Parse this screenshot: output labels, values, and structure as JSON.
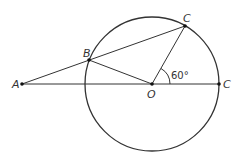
{
  "diagram": {
    "type": "geometry",
    "circle": {
      "center": "O",
      "cx": 152,
      "cy": 84,
      "r": 67
    },
    "points": [
      {
        "id": "A",
        "label": "A",
        "x": 22,
        "y": 84
      },
      {
        "id": "B",
        "label": "B",
        "x": 89,
        "y": 60
      },
      {
        "id": "O",
        "label": "O",
        "x": 152,
        "y": 84
      },
      {
        "id": "C_top",
        "label": "C",
        "x": 185,
        "y": 26
      },
      {
        "id": "C_right",
        "label": "C",
        "x": 219,
        "y": 84
      }
    ],
    "segments": [
      [
        "A",
        "C_right"
      ],
      [
        "A",
        "C_top"
      ],
      [
        "B",
        "O"
      ],
      [
        "O",
        "C_top"
      ]
    ],
    "angle": {
      "vertex": "O",
      "label": "60°"
    },
    "colors": {
      "stroke": "#333333",
      "background": "#ffffff"
    }
  }
}
